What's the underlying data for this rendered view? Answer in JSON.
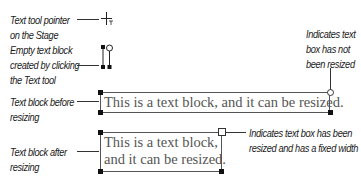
{
  "callouts": {
    "pointer": [
      "Text tool pointer",
      "on the Stage"
    ],
    "empty_block": [
      "Empty text block",
      "created by clicking",
      "the Text tool"
    ],
    "before": [
      "Text block before",
      "resizing"
    ],
    "after": [
      "Text block after",
      "resizing"
    ],
    "not_resized": [
      "Indicates text",
      "box has not",
      "been resized"
    ],
    "resized": [
      "Indicates text box has been",
      "resized and has a fixed width"
    ]
  },
  "text_blocks": {
    "before": "This is a text block, and it can be resized.",
    "after_line1": "This is a text block,",
    "after_line2": "and it can be resized."
  },
  "icons": {
    "text_tool_pointer": "crosshair-with-T",
    "unresized_handle": "circle-handle",
    "resized_handle": "square-handle"
  }
}
